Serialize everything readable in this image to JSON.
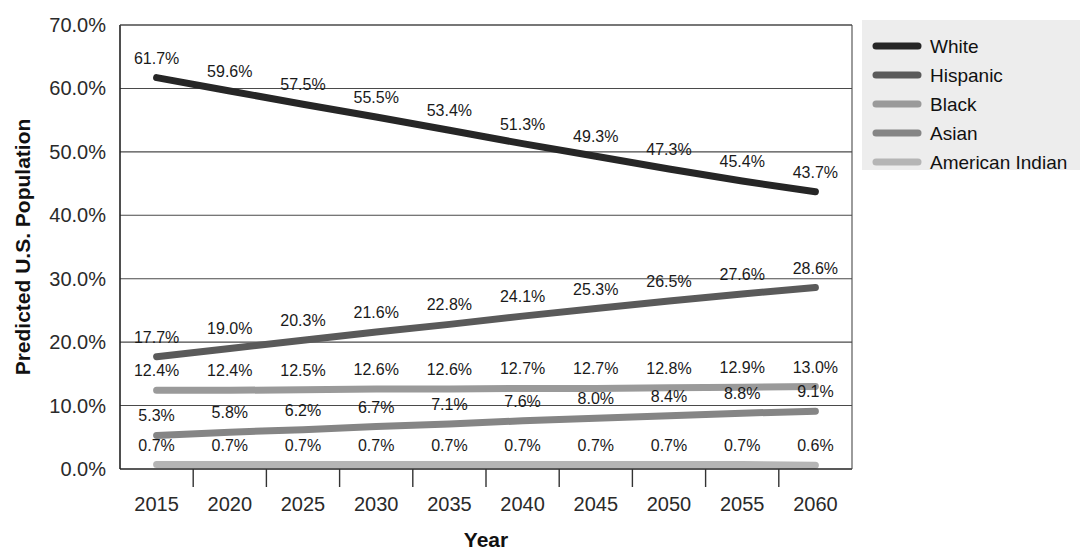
{
  "chart_data": {
    "type": "line",
    "title": "",
    "xlabel": "Year",
    "ylabel": "Predicted U.S. Population",
    "categories": [
      "2015",
      "2020",
      "2025",
      "2030",
      "2035",
      "2040",
      "2045",
      "2050",
      "2055",
      "2060"
    ],
    "ylim": [
      0,
      70
    ],
    "ytick_step": 10,
    "ytick_labels": [
      "0.0%",
      "10.0%",
      "20.0%",
      "30.0%",
      "40.0%",
      "50.0%",
      "60.0%",
      "70.0%"
    ],
    "ytick_values": [
      0,
      10,
      20,
      30,
      40,
      50,
      60,
      70
    ],
    "grid": true,
    "legend_position": "right",
    "value_suffix": "%",
    "series": [
      {
        "name": "White",
        "color": "#262626",
        "values": [
          61.7,
          59.6,
          57.5,
          55.5,
          53.4,
          51.3,
          49.3,
          47.3,
          45.4,
          43.7
        ],
        "labels": [
          "61.7%",
          "59.6%",
          "57.5%",
          "55.5%",
          "53.4%",
          "51.3%",
          "49.3%",
          "47.3%",
          "45.4%",
          "43.7%"
        ]
      },
      {
        "name": "Hispanic",
        "color": "#5a5a5a",
        "values": [
          17.7,
          19.0,
          20.3,
          21.6,
          22.8,
          24.1,
          25.3,
          26.5,
          27.6,
          28.6
        ],
        "labels": [
          "17.7%",
          "19.0%",
          "20.3%",
          "21.6%",
          "22.8%",
          "24.1%",
          "25.3%",
          "26.5%",
          "27.6%",
          "28.6%"
        ]
      },
      {
        "name": "Black",
        "color": "#9a9a9a",
        "values": [
          12.4,
          12.4,
          12.5,
          12.6,
          12.6,
          12.7,
          12.7,
          12.8,
          12.9,
          13.0
        ],
        "labels": [
          "12.4%",
          "12.4%",
          "12.5%",
          "12.6%",
          "12.6%",
          "12.7%",
          "12.7%",
          "12.8%",
          "12.9%",
          "13.0%"
        ]
      },
      {
        "name": "Asian",
        "color": "#858585",
        "values": [
          5.3,
          5.8,
          6.2,
          6.7,
          7.1,
          7.6,
          8.0,
          8.4,
          8.8,
          9.1
        ],
        "labels": [
          "5.3%",
          "5.8%",
          "6.2%",
          "6.7%",
          "7.1%",
          "7.6%",
          "8.0%",
          "8.4%",
          "8.8%",
          "9.1%"
        ]
      },
      {
        "name": "American Indian",
        "color": "#b5b5b5",
        "values": [
          0.7,
          0.7,
          0.7,
          0.7,
          0.7,
          0.7,
          0.7,
          0.7,
          0.7,
          0.6
        ],
        "labels": [
          "0.7%",
          "0.7%",
          "0.7%",
          "0.7%",
          "0.7%",
          "0.7%",
          "0.7%",
          "0.7%",
          "0.7%",
          "0.6%"
        ]
      }
    ]
  },
  "legend": {
    "items": [
      {
        "label": "White",
        "color": "#262626"
      },
      {
        "label": "Hispanic",
        "color": "#5a5a5a"
      },
      {
        "label": "Black",
        "color": "#9a9a9a"
      },
      {
        "label": "Asian",
        "color": "#858585"
      },
      {
        "label": "American Indian",
        "color": "#b5b5b5"
      }
    ]
  }
}
